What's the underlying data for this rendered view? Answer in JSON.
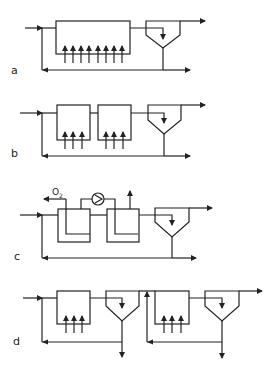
{
  "figure": {
    "panels": [
      {
        "id": "a",
        "label": "a",
        "description": "Single aerated tank with clarifier and sludge recycle",
        "aerator_arrows": 8
      },
      {
        "id": "b",
        "label": "b",
        "description": "Two aerated tanks in series with clarifier and sludge recycle",
        "aerator_arrows": 6
      },
      {
        "id": "c",
        "label": "c",
        "description": "Two tanks with oxygen feed and pump recirculation, clarifier and sludge recycle",
        "oxygen_label": "O",
        "oxygen_subscript": "2"
      },
      {
        "id": "d",
        "label": "d",
        "description": "Two-stage system: each stage aerated tank plus clarifier with own sludge recycle and excess sludge withdrawal",
        "aerator_arrows": 6
      }
    ]
  },
  "colors": {
    "line": "#222222",
    "background": "#ffffff"
  }
}
